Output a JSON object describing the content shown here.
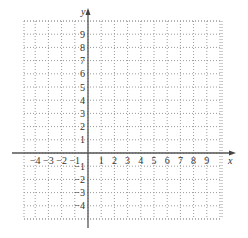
{
  "diagram": {
    "type": "coordinate-plane",
    "x_axis": {
      "label": "x",
      "min": -5,
      "max": 10,
      "tick_labels": [
        "-4",
        "-3",
        "-2",
        "-1",
        "1",
        "2",
        "3",
        "4",
        "5",
        "6",
        "7",
        "8",
        "9"
      ]
    },
    "y_axis": {
      "label": "y",
      "min": -5,
      "max": 10,
      "tick_labels": [
        "9",
        "8",
        "7",
        "6",
        "5",
        "4",
        "3",
        "2",
        "1",
        "-1",
        "-2",
        "-3",
        "-4"
      ]
    },
    "grid": {
      "style": "dotted",
      "spacing": 1
    },
    "colors": {
      "grid": "#9a9a9a",
      "axis": "#555555",
      "text": "#333333"
    }
  },
  "geometry": {
    "origin_x": 88,
    "origin_y": 153,
    "unit": 13.2,
    "grid_left": 24,
    "grid_right": 222,
    "grid_top": 21,
    "grid_bottom": 219
  }
}
